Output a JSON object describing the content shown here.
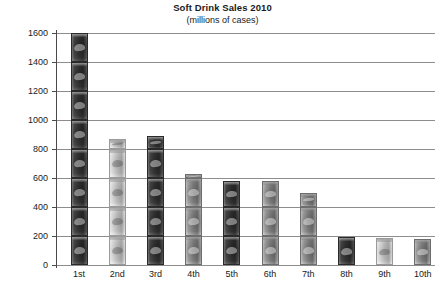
{
  "chart_data": {
    "type": "bar",
    "title": "Soft Drink Sales 2010",
    "subtitle": "(millions of cases)",
    "xlabel": "",
    "ylabel": "",
    "categories": [
      "1st",
      "2nd",
      "3rd",
      "4th",
      "5th",
      "6th",
      "7th",
      "8th",
      "9th",
      "10th"
    ],
    "values": [
      1600,
      870,
      890,
      625,
      580,
      580,
      500,
      190,
      185,
      180
    ],
    "ylim": [
      0,
      1600
    ],
    "ytick_labels": [
      "1600",
      "1400",
      "1200",
      "1000",
      "800",
      "600",
      "400",
      "200",
      "0"
    ],
    "ytick_values": [
      1600,
      1400,
      1200,
      1000,
      800,
      600,
      400,
      200,
      0
    ],
    "grid": true,
    "legend": false,
    "style": "pictorial-grayscale-soda-cans"
  },
  "axis": {
    "y_axis_color": "#4a4a4a",
    "gridline_color": "#8d8d8d"
  }
}
